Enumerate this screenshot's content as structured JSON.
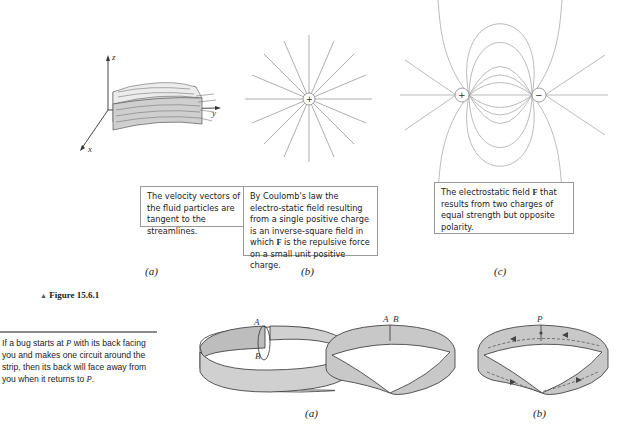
{
  "figure_top": {
    "title": "Figure 15.6.1",
    "title_marker": "▲",
    "panels": [
      {
        "label": "(a)",
        "axis_labels": {
          "z": "z",
          "y": "y",
          "x": "x"
        },
        "caption": "The velocity vectors of the fluid particles are tangent to the streamlines."
      },
      {
        "label": "(b)",
        "charge_symbol": "+",
        "caption_parts": {
          "before": "By Coulomb's law the electro-static field resulting from a single positive charge is an inverse-square field in which ",
          "bold": "F",
          "after": " is the repulsive force on a small unit positive charge."
        }
      },
      {
        "label": "(c)",
        "charge_positive": "+",
        "charge_negative": "−",
        "caption_parts": {
          "before": "The electrostatic field ",
          "bold": "F",
          "after": " that results from two charges of equal strength but opposite polarity."
        }
      }
    ]
  },
  "figure_bottom": {
    "side_note": {
      "before_p1": "If a bug starts at ",
      "p": "P",
      "middle": " with its back facing you and makes one circuit around the strip, then its back will face away from you when it returns to ",
      "end": "."
    },
    "panel_a_label": "(a)",
    "panel_b_label": "(b)",
    "point_labels": {
      "A": "A",
      "B": "B",
      "P": "P"
    }
  }
}
